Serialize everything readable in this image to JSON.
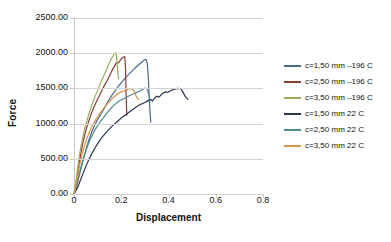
{
  "chart_data": {
    "type": "line",
    "title": "",
    "xlabel": "Displacement",
    "ylabel": "Force",
    "xlim": [
      0,
      0.8
    ],
    "ylim": [
      0,
      2500
    ],
    "xticks": [
      "0",
      "0.2",
      "0.4",
      "0.6",
      "0.8"
    ],
    "xtick_values": [
      0,
      0.2,
      0.4,
      0.6,
      0.8
    ],
    "yticks": [
      "0.00",
      "500.00",
      "1000.00",
      "1500.00",
      "2000.00",
      "2500.00"
    ],
    "ytick_values": [
      0,
      500,
      1000,
      1500,
      2000,
      2500
    ],
    "grid": "horizontal",
    "legend_position": "right",
    "series": [
      {
        "name": "c=1,50 mm –196 C",
        "color": "#4a6b8a",
        "points": [
          [
            0.0,
            0
          ],
          [
            0.012,
            120
          ],
          [
            0.025,
            300
          ],
          [
            0.038,
            470
          ],
          [
            0.05,
            620
          ],
          [
            0.062,
            760
          ],
          [
            0.075,
            880
          ],
          [
            0.088,
            980
          ],
          [
            0.1,
            1060
          ],
          [
            0.115,
            1140
          ],
          [
            0.13,
            1230
          ],
          [
            0.145,
            1320
          ],
          [
            0.16,
            1400
          ],
          [
            0.175,
            1470
          ],
          [
            0.19,
            1540
          ],
          [
            0.205,
            1600
          ],
          [
            0.22,
            1660
          ],
          [
            0.235,
            1710
          ],
          [
            0.25,
            1760
          ],
          [
            0.262,
            1800
          ],
          [
            0.275,
            1840
          ],
          [
            0.288,
            1875
          ],
          [
            0.298,
            1905
          ],
          [
            0.305,
            1912
          ],
          [
            0.31,
            1860
          ],
          [
            0.314,
            1700
          ],
          [
            0.318,
            1400
          ],
          [
            0.322,
            1150
          ],
          [
            0.325,
            1020
          ]
        ]
      },
      {
        "name": "c=2,50 mm –196 C",
        "color": "#8c3b33",
        "points": [
          [
            0.0,
            0
          ],
          [
            0.01,
            180
          ],
          [
            0.02,
            400
          ],
          [
            0.03,
            600
          ],
          [
            0.04,
            760
          ],
          [
            0.05,
            900
          ],
          [
            0.06,
            1010
          ],
          [
            0.07,
            1110
          ],
          [
            0.08,
            1200
          ],
          [
            0.092,
            1290
          ],
          [
            0.105,
            1380
          ],
          [
            0.118,
            1470
          ],
          [
            0.13,
            1550
          ],
          [
            0.142,
            1620
          ],
          [
            0.152,
            1690
          ],
          [
            0.162,
            1760
          ],
          [
            0.172,
            1820
          ],
          [
            0.18,
            1870
          ],
          [
            0.186,
            1860
          ],
          [
            0.192,
            1880
          ],
          [
            0.2,
            1920
          ],
          [
            0.208,
            1945
          ],
          [
            0.215,
            1950
          ],
          [
            0.218,
            1800
          ],
          [
            0.22,
            1500
          ],
          [
            0.222,
            1250
          ],
          [
            0.224,
            1120
          ]
        ]
      },
      {
        "name": "c=3,50 mm –196 C",
        "color": "#9aab5e",
        "points": [
          [
            0.0,
            0
          ],
          [
            0.009,
            200
          ],
          [
            0.018,
            440
          ],
          [
            0.028,
            650
          ],
          [
            0.038,
            820
          ],
          [
            0.048,
            960
          ],
          [
            0.058,
            1080
          ],
          [
            0.068,
            1190
          ],
          [
            0.078,
            1290
          ],
          [
            0.09,
            1390
          ],
          [
            0.102,
            1490
          ],
          [
            0.114,
            1590
          ],
          [
            0.126,
            1680
          ],
          [
            0.138,
            1770
          ],
          [
            0.148,
            1850
          ],
          [
            0.158,
            1920
          ],
          [
            0.168,
            1975
          ],
          [
            0.176,
            2010
          ],
          [
            0.18,
            1960
          ],
          [
            0.183,
            1820
          ],
          [
            0.186,
            1700
          ],
          [
            0.189,
            1640
          ]
        ]
      },
      {
        "name": "c=1,50 mm 22 C",
        "color": "#2a3550",
        "points": [
          [
            0.0,
            0
          ],
          [
            0.015,
            90
          ],
          [
            0.03,
            220
          ],
          [
            0.045,
            350
          ],
          [
            0.06,
            470
          ],
          [
            0.075,
            570
          ],
          [
            0.09,
            660
          ],
          [
            0.105,
            740
          ],
          [
            0.12,
            810
          ],
          [
            0.14,
            890
          ],
          [
            0.16,
            960
          ],
          [
            0.18,
            1020
          ],
          [
            0.2,
            1080
          ],
          [
            0.22,
            1130
          ],
          [
            0.24,
            1180
          ],
          [
            0.26,
            1230
          ],
          [
            0.28,
            1270
          ],
          [
            0.3,
            1300
          ],
          [
            0.315,
            1330
          ],
          [
            0.325,
            1345
          ],
          [
            0.332,
            1320
          ],
          [
            0.34,
            1360
          ],
          [
            0.35,
            1390
          ],
          [
            0.36,
            1375
          ],
          [
            0.372,
            1420
          ],
          [
            0.385,
            1450
          ],
          [
            0.398,
            1445
          ],
          [
            0.41,
            1470
          ],
          [
            0.425,
            1490
          ],
          [
            0.44,
            1500
          ],
          [
            0.452,
            1495
          ],
          [
            0.462,
            1440
          ],
          [
            0.472,
            1380
          ],
          [
            0.482,
            1345
          ]
        ]
      },
      {
        "name": "c=2,50 mm 22 C",
        "color": "#4d8a92",
        "points": [
          [
            0.0,
            0
          ],
          [
            0.013,
            150
          ],
          [
            0.026,
            340
          ],
          [
            0.04,
            510
          ],
          [
            0.054,
            650
          ],
          [
            0.068,
            770
          ],
          [
            0.082,
            870
          ],
          [
            0.096,
            950
          ],
          [
            0.112,
            1030
          ],
          [
            0.128,
            1100
          ],
          [
            0.144,
            1170
          ],
          [
            0.16,
            1230
          ],
          [
            0.176,
            1280
          ],
          [
            0.192,
            1320
          ],
          [
            0.208,
            1350
          ],
          [
            0.222,
            1375
          ],
          [
            0.236,
            1400
          ],
          [
            0.25,
            1420
          ],
          [
            0.264,
            1440
          ],
          [
            0.278,
            1460
          ],
          [
            0.292,
            1490
          ],
          [
            0.302,
            1505
          ],
          [
            0.31,
            1490
          ],
          [
            0.316,
            1420
          ],
          [
            0.32,
            1360
          ],
          [
            0.324,
            1330
          ]
        ]
      },
      {
        "name": "c=3,50 mm 22 C",
        "color": "#d79449",
        "points": [
          [
            0.0,
            0
          ],
          [
            0.011,
            170
          ],
          [
            0.022,
            380
          ],
          [
            0.034,
            560
          ],
          [
            0.046,
            700
          ],
          [
            0.058,
            820
          ],
          [
            0.07,
            920
          ],
          [
            0.082,
            1000
          ],
          [
            0.096,
            1080
          ],
          [
            0.11,
            1150
          ],
          [
            0.124,
            1210
          ],
          [
            0.138,
            1270
          ],
          [
            0.152,
            1320
          ],
          [
            0.166,
            1370
          ],
          [
            0.18,
            1410
          ],
          [
            0.194,
            1440
          ],
          [
            0.208,
            1460
          ],
          [
            0.222,
            1480
          ],
          [
            0.236,
            1495
          ],
          [
            0.248,
            1490
          ],
          [
            0.256,
            1450
          ],
          [
            0.262,
            1400
          ],
          [
            0.268,
            1360
          ],
          [
            0.274,
            1340
          ]
        ]
      }
    ]
  }
}
